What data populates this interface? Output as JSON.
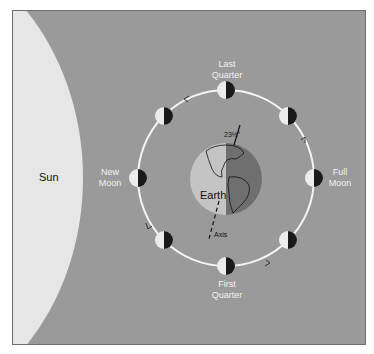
{
  "colors": {
    "background": "#9a9a9a",
    "sun": "#e6e6e6",
    "orbit": "#f4f4f4",
    "earth_day": "#c4c4c4",
    "earth_night": "#6f6f6f",
    "moon_lit": "#ececec",
    "moon_dark": "#1a1a1a"
  },
  "labels": {
    "sun": "Sun",
    "earth": "Earth",
    "axis": "Axis",
    "tilt": "23½°",
    "phases": {
      "last_quarter": [
        "Last",
        "Quarter"
      ],
      "first_quarter": [
        "First",
        "Quarter"
      ],
      "new_moon": [
        "New",
        "Moon"
      ],
      "full_moon": [
        "Full",
        "Moon"
      ]
    }
  }
}
